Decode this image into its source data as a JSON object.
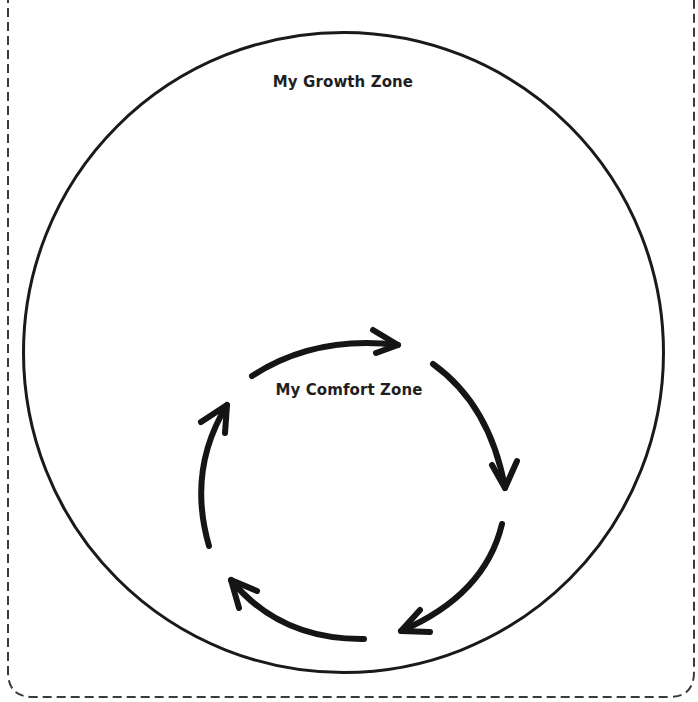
{
  "diagram": {
    "type": "nested-zones",
    "outer_zone": {
      "label": "My Growth Zone",
      "shape": "circle"
    },
    "inner_zone": {
      "label": "My Comfort Zone",
      "shape": "cycle-of-arrows",
      "arrow_count": 5,
      "direction": "clockwise"
    },
    "frame": {
      "style": "dashed-rounded-border"
    },
    "colors": {
      "stroke": "#1a1a1a",
      "text": "#1f1f1f",
      "background": "#ffffff",
      "frame": "#3a3a3a"
    }
  }
}
